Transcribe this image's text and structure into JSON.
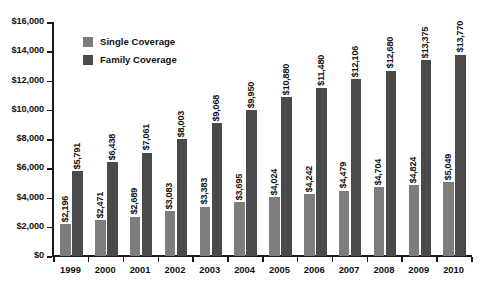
{
  "chart_data": {
    "type": "bar",
    "title": "",
    "xlabel": "",
    "ylabel": "",
    "ylim": [
      0,
      16000
    ],
    "grid": false,
    "legend_position": "inside-top-left",
    "categories": [
      "1999",
      "2000",
      "2001",
      "2002",
      "2003",
      "2004",
      "2005",
      "2006",
      "2007",
      "2008",
      "2009",
      "2010"
    ],
    "y_ticks": [
      0,
      2000,
      4000,
      6000,
      8000,
      10000,
      12000,
      14000,
      16000
    ],
    "y_tick_labels": [
      "$0",
      "$2,000",
      "$4,000",
      "$6,000",
      "$8,000",
      "$10,000",
      "$12,000",
      "$14,000",
      "$16,000"
    ],
    "series": [
      {
        "name": "Single Coverage",
        "color": "#7d7d7d",
        "values": [
          2196,
          2471,
          2689,
          3083,
          3383,
          3695,
          4024,
          4242,
          4479,
          4704,
          4824,
          5049
        ],
        "labels": [
          "$2,196",
          "$2,471",
          "$2,689",
          "$3,083",
          "$3,383",
          "$3,695",
          "$4,024",
          "$4,242",
          "$4,479",
          "$4,704",
          "$4,824",
          "$5,049"
        ]
      },
      {
        "name": "Family Coverage",
        "color": "#4a4a4a",
        "values": [
          5791,
          6438,
          7061,
          8003,
          9068,
          9950,
          10880,
          11480,
          12106,
          12680,
          13375,
          13770
        ],
        "labels": [
          "$5,791",
          "$6,438",
          "$7,061",
          "$8,003",
          "$9,068",
          "$9,950",
          "$10,880",
          "$11,480",
          "$12,106",
          "$12,680",
          "$13,375",
          "$13,770"
        ]
      }
    ]
  },
  "legend": {
    "items": [
      {
        "label": "Single Coverage",
        "color": "#7d7d7d"
      },
      {
        "label": "Family Coverage",
        "color": "#4a4a4a"
      }
    ]
  }
}
